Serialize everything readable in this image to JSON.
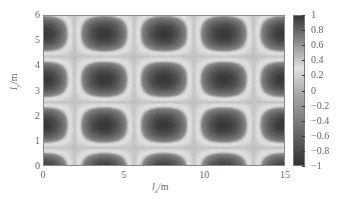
{
  "chart_data": {
    "type": "heatmap",
    "title": "",
    "xlabel": "l_x/m",
    "ylabel": "l_y/m",
    "xlim": [
      0,
      15
    ],
    "ylim": [
      0,
      6
    ],
    "x_ticks": [
      "0",
      "5",
      "10",
      "15"
    ],
    "y_ticks": [
      "0",
      "1",
      "2",
      "3",
      "4",
      "5",
      "6"
    ],
    "colorbar": {
      "range": [
        -1,
        1
      ],
      "ticks": [
        "1",
        "0.8",
        "0.6",
        "0.4",
        "0.2",
        "0",
        "−0.2",
        "−0.4",
        "−0.6",
        "−0.8",
        "−1"
      ],
      "colormap": "gray, dark at both ends, lightest near 0.2–0.4"
    },
    "pattern": {
      "description": "Regular grid of dark rounded-rectangular blobs separated by light bands",
      "blob_centers_x": [
        0,
        3.75,
        7.5,
        11.25,
        15
      ],
      "blob_centers_y": [
        0,
        1.6,
        3.4,
        5.3
      ],
      "x_period": 3.75,
      "y_period": 1.85
    },
    "grid": false,
    "legend": "colorbar right"
  },
  "axes": {
    "xlabel_main": "l",
    "xlabel_sub": "x",
    "xlabel_unit": "/m",
    "ylabel_main": "l",
    "ylabel_sub": "y",
    "ylabel_unit": "/m"
  }
}
